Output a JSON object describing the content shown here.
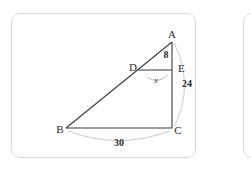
{
  "figure": {
    "stroke_color": "#3b3b3b",
    "arc_color": "#b9b9b9",
    "card_border_color": "#d8d8d8",
    "background_color": "#ffffff",
    "vertices": [
      {
        "name": "A",
        "label": "A",
        "x": 161,
        "y": 27
      },
      {
        "name": "B",
        "label": "B",
        "x": 55,
        "y": 115
      },
      {
        "name": "C",
        "label": "C",
        "x": 161,
        "y": 115
      },
      {
        "name": "D",
        "label": "D",
        "x": 127,
        "y": 57
      },
      {
        "name": "E",
        "label": "E",
        "x": 161,
        "y": 57
      }
    ],
    "measures": {
      "ae_label": "8",
      "ec_label": "24",
      "bc_label": "30",
      "angle_d_label": "x"
    },
    "segments": [
      {
        "name": "side-AB",
        "from": "A",
        "to": "B"
      },
      {
        "name": "side-BC",
        "from": "B",
        "to": "C"
      },
      {
        "name": "side-AC",
        "from": "A",
        "to": "C"
      },
      {
        "name": "segment-DE",
        "from": "D",
        "to": "E"
      }
    ],
    "arcs": [
      {
        "name": "dimension-arc-AC",
        "from": "A",
        "to": "C",
        "label": "24"
      },
      {
        "name": "dimension-arc-BC",
        "from": "B",
        "to": "C",
        "label": "30"
      },
      {
        "name": "angle-arc-D",
        "at": "D",
        "label": "x"
      }
    ]
  }
}
